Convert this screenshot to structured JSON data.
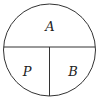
{
  "diagram": {
    "type": "circle-partition",
    "regions": [
      {
        "id": "top",
        "label": "A"
      },
      {
        "id": "bottom-left",
        "label": "P"
      },
      {
        "id": "bottom-right",
        "label": "B"
      }
    ],
    "stroke_color": "#333333",
    "background": "#ffffff"
  }
}
